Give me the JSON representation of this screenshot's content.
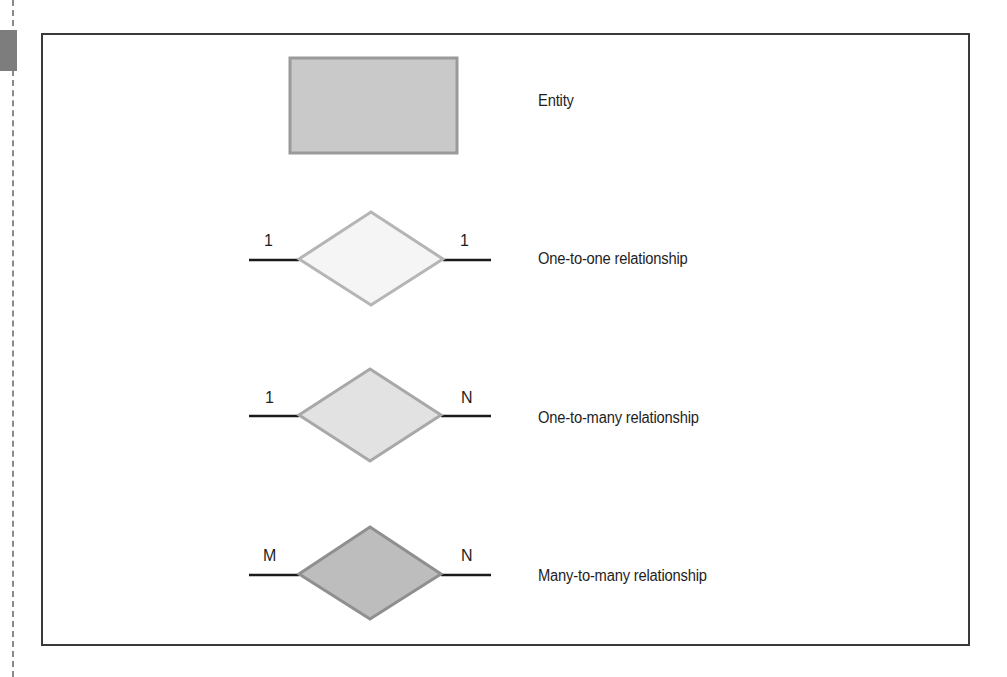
{
  "legend": {
    "items": [
      {
        "shape": "rectangle",
        "label": "Entity",
        "fill": "#c8c8c8",
        "stroke": "#9a9a9a"
      },
      {
        "shape": "diamond",
        "label": "One-to-one relationship",
        "left_cardinality": "1",
        "right_cardinality": "1",
        "fill": "#f4f4f4",
        "stroke": "#b5b5b5"
      },
      {
        "shape": "diamond",
        "label": "One-to-many relationship",
        "left_cardinality": "1",
        "right_cardinality": "N",
        "fill": "#e2e2e2",
        "stroke": "#a8a8a8"
      },
      {
        "shape": "diamond",
        "label": "Many-to-many relationship",
        "left_cardinality": "M",
        "right_cardinality": "N",
        "fill": "#bdbdbd",
        "stroke": "#8f8f8f"
      }
    ]
  },
  "colors": {
    "frame_border": "#3a3a3a",
    "connector_line": "#1a1a1a",
    "side_tab": "#7d7d7d"
  }
}
